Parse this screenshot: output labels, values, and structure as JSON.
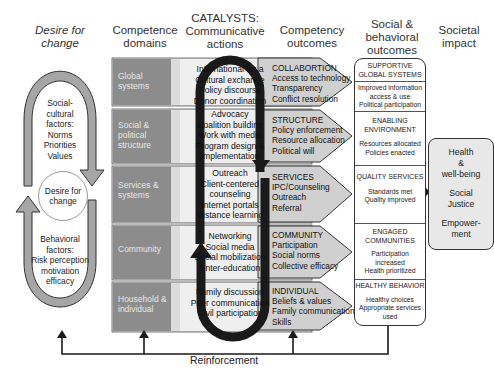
{
  "headers": {
    "desire": "Desire for change",
    "competence": "Competence domains",
    "catalysts": "CATALYSTS: Communicative actions",
    "competency_outcomes": "Competency outcomes",
    "social_behavioral": "Social & behavioral outcomes",
    "societal_impact": "Societal impact"
  },
  "desire_cycle": {
    "upper_factors": [
      "Social-",
      "cultural",
      "factors:",
      "Norms",
      "Priorities",
      "Values"
    ],
    "center": "Desire for change",
    "lower_factors": [
      "Behavioral",
      "factors:",
      "Risk perception",
      "motivation",
      "efficacy"
    ]
  },
  "domains": [
    {
      "label": "Global systems"
    },
    {
      "label": "Social & political structure"
    },
    {
      "label": "Services & systems"
    },
    {
      "label": "Community"
    },
    {
      "label": "Household & individual"
    }
  ],
  "actions": [
    {
      "lines": [
        "International for a",
        "Cultural exchange",
        "Policy discourse",
        "Donor coordination"
      ]
    },
    {
      "lines": [
        "Advocacy",
        "Coalition building",
        "Work with media",
        "Program design &",
        "Implementation"
      ]
    },
    {
      "lines": [
        "Outreach",
        "Client-centered",
        "counseling",
        "Internet portals",
        "Distance learning"
      ]
    },
    {
      "lines": [
        "Networking",
        "Social media",
        "Social mobilization",
        "Enter-education"
      ]
    },
    {
      "lines": [
        "Family discussion",
        "Peer communication",
        "Civil participation"
      ]
    }
  ],
  "competency_outcomes": [
    {
      "title": "COLLABORTION",
      "items": [
        "Access to technology",
        "Transparency",
        "Conflict resolution"
      ]
    },
    {
      "title": "STRUCTURE",
      "items": [
        "Policy enforcement",
        "Resource allocation",
        "Political will"
      ]
    },
    {
      "title": "SERVICES",
      "items": [
        "IPC/Counseling",
        "Outreach",
        "Referral"
      ]
    },
    {
      "title": "COMMUNITY",
      "items": [
        "Participation",
        "Social norms",
        "Collective efficacy"
      ]
    },
    {
      "title": "INDIVIDUAL",
      "items": [
        "Beliefs & values",
        "Family communication",
        "Skills"
      ]
    }
  ],
  "social_behavioral_outcomes": [
    {
      "title": "SUPPORTIVE GLOBAL SYSTEMS",
      "detail": [
        "Improved information",
        "access & use",
        "Political participation"
      ]
    },
    {
      "title": "ENABLING ENVIRONMENT",
      "detail": [
        "Resources allocated",
        "Policies enacted"
      ]
    },
    {
      "title": "QUALITY SERVICES",
      "detail": [
        "Standards met",
        "Quality improved"
      ]
    },
    {
      "title": "ENGAGED COMMUNITIES",
      "detail": [
        "Participation",
        "increased",
        "Health prioritized"
      ]
    },
    {
      "title": "HEALTHY BEHAVIOR",
      "detail": [
        "Healthy choices",
        "Appropriate services",
        "used"
      ]
    }
  ],
  "societal_impact": [
    "Health",
    "&",
    "well-being",
    "Social",
    "Justice",
    "Empower-",
    "ment"
  ],
  "feedback": {
    "label": "Reinforcement"
  },
  "colors": {
    "domain_fill": "#8c8c8c",
    "band_fill": "#d9d9d9",
    "action_fill": "#efefef",
    "outcome_fill": "#cfcfcf",
    "arrow_fill": "#a6a6a6",
    "loop_stroke": "#1a1a1a"
  }
}
